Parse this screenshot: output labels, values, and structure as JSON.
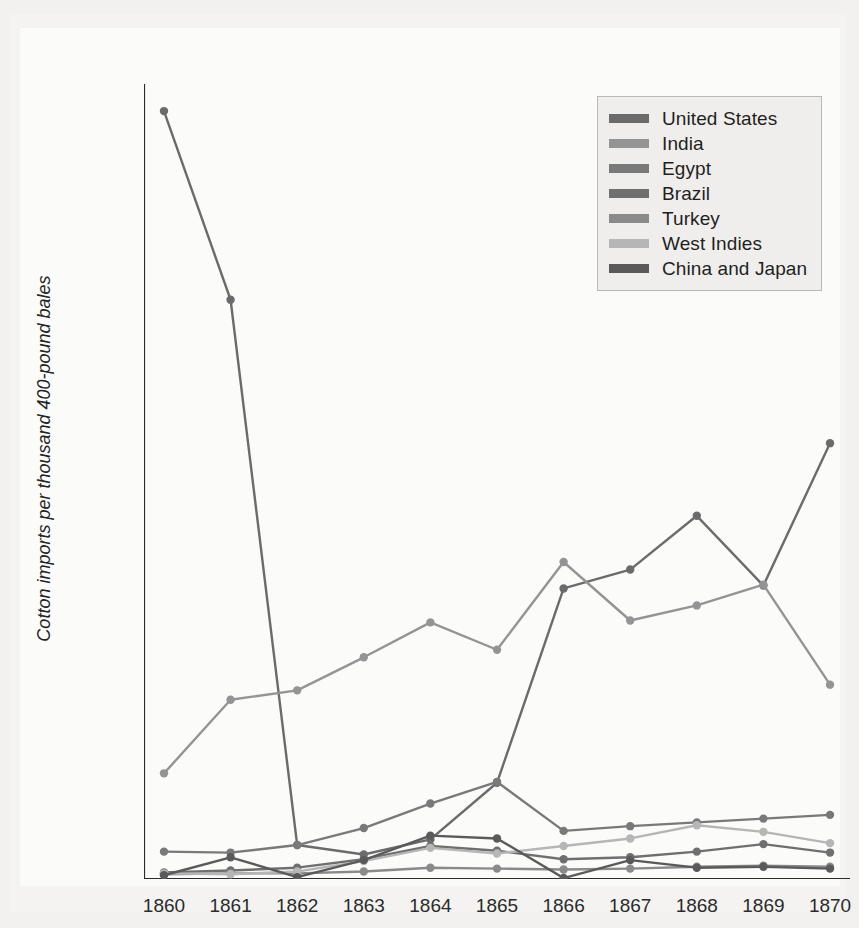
{
  "chart_data": {
    "type": "line",
    "title": "",
    "xlabel": "",
    "ylabel": "Cotton imports per thousand 400-pound bales",
    "x": [
      1860,
      1861,
      1862,
      1863,
      1864,
      1865,
      1866,
      1867,
      1868,
      1869,
      1870
    ],
    "xtick_labels": [
      "1860",
      "1861",
      "1862",
      "1863",
      "1864",
      "1865",
      "1866",
      "1867",
      "1868",
      "1869",
      "1870"
    ],
    "ytick_labels": [
      "0",
      "500",
      "1000",
      "1500",
      "2000",
      "2500",
      "3000",
      "3500",
      "4000"
    ],
    "yticks": [
      0,
      500,
      1000,
      1500,
      2000,
      2500,
      3000,
      3500,
      4000
    ],
    "ylim": [
      0,
      4150
    ],
    "xlim": [
      1859.7,
      1870.3
    ],
    "grid": false,
    "minor_ticks": true,
    "legend_position": "top-right",
    "series": [
      {
        "name": "United States",
        "color": "#6b6b6b",
        "values": [
          4070,
          3070,
          180,
          130,
          210,
          510,
          1540,
          1640,
          1925,
          1555,
          2310
        ]
      },
      {
        "name": "India",
        "color": "#949494",
        "values": [
          560,
          950,
          1000,
          1175,
          1360,
          1215,
          1680,
          1370,
          1450,
          1560,
          1030
        ]
      },
      {
        "name": "Egypt",
        "color": "#797979",
        "values": [
          145,
          140,
          180,
          270,
          400,
          515,
          255,
          280,
          300,
          320,
          340
        ]
      },
      {
        "name": "Brazil",
        "color": "#6f6f6f",
        "values": [
          35,
          45,
          60,
          105,
          175,
          150,
          105,
          115,
          145,
          185,
          140
        ]
      },
      {
        "name": "Turkey",
        "color": "#8a8a8a",
        "values": [
          25,
          30,
          30,
          40,
          60,
          55,
          50,
          55,
          65,
          70,
          65
        ]
      },
      {
        "name": "West Indies",
        "color": "#b6b6b6",
        "values": [
          30,
          25,
          40,
          95,
          165,
          135,
          175,
          215,
          285,
          250,
          190
        ]
      },
      {
        "name": "China and Japan",
        "color": "#5a5a5a",
        "values": [
          20,
          115,
          10,
          100,
          230,
          215,
          5,
          100,
          60,
          65,
          55
        ]
      }
    ]
  },
  "legend": {
    "items": [
      {
        "label": "United States"
      },
      {
        "label": "India"
      },
      {
        "label": "Egypt"
      },
      {
        "label": "Brazil"
      },
      {
        "label": "Turkey"
      },
      {
        "label": "West Indies"
      },
      {
        "label": "China and Japan"
      }
    ]
  },
  "colors": {
    "page_background": "#f2f1ef",
    "figure_background": "#fbfbfa",
    "axis": "#2b2b2b",
    "legend_background": "#efeeec",
    "legend_border": "#b9b8b5",
    "text": "#2b2b2b"
  }
}
